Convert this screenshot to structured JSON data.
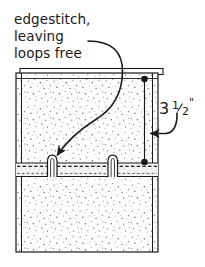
{
  "diagram": {
    "annotations": {
      "callout": {
        "line1": "edgestitch,",
        "line2": "leaving",
        "line3": "loops free",
        "target": "fabric-loop-left"
      },
      "dimension": {
        "whole": "3",
        "fraction_numerator": "1",
        "fraction_denominator": "2",
        "unit": "\"",
        "full_label": "3 1/2\"",
        "measures": "distance from top edge to loop band"
      }
    },
    "colors": {
      "ink": "#1a1a1a",
      "fabric_fill": "#fdfdfd",
      "speckle": "#6b6b6b",
      "band_fill": "#f2f2f2",
      "paper": "#ffffff"
    },
    "parts": [
      {
        "name": "fabric-panel",
        "label": "speckled fabric panel"
      },
      {
        "name": "top-folded-edge",
        "label": "folded top edge layer"
      },
      {
        "name": "loop-band",
        "label": "stitched band with dashed edgestitch"
      },
      {
        "name": "fabric-loop-left",
        "label": "left free loop"
      },
      {
        "name": "fabric-loop-right",
        "label": "right free loop"
      },
      {
        "name": "dimension-line",
        "label": "vertical dimension line with end dots"
      }
    ]
  }
}
